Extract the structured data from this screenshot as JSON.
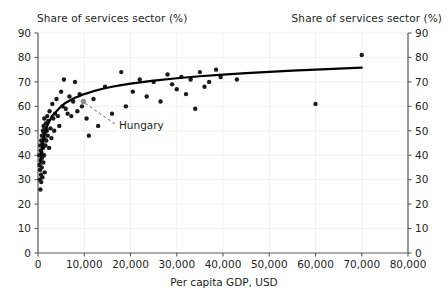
{
  "chart_data": {
    "type": "scatter",
    "title": "",
    "xlabel": "Per capita GDP, USD",
    "ylabel_left": "Share of services sector (%)",
    "ylabel_right": "Share of services sector (%)",
    "xlim": [
      0,
      80000
    ],
    "ylim": [
      0,
      90
    ],
    "xticks": [
      0,
      10000,
      20000,
      30000,
      40000,
      50000,
      60000,
      70000,
      80000
    ],
    "xtick_labels": [
      "0",
      "10,000",
      "20,000",
      "30,000",
      "40,000",
      "50,000",
      "60,000",
      "70,000",
      "80,000"
    ],
    "yticks": [
      0,
      10,
      20,
      30,
      40,
      50,
      60,
      70,
      80,
      90
    ],
    "ytick_labels": [
      "0",
      "10",
      "20",
      "30",
      "40",
      "50",
      "60",
      "70",
      "80",
      "90"
    ],
    "grid": true,
    "legend": "none",
    "marker_color": "#1a1a1a",
    "trendline_color": "#000000",
    "highlight_color": "#8c8c8c",
    "gridline_color": "#f0f0f0",
    "annotations": [
      {
        "label": "Hungary",
        "point_x": 9800,
        "point_y": 62,
        "label_x": 17500,
        "label_y": 52,
        "marker_color": "#8c8c8c",
        "leader_style": "dashed"
      }
    ],
    "series": [
      {
        "name": "Countries",
        "points": [
          [
            300,
            40
          ],
          [
            350,
            36
          ],
          [
            400,
            30
          ],
          [
            450,
            34
          ],
          [
            500,
            44
          ],
          [
            520,
            26
          ],
          [
            560,
            38
          ],
          [
            600,
            42
          ],
          [
            640,
            32
          ],
          [
            680,
            46
          ],
          [
            700,
            29
          ],
          [
            760,
            41
          ],
          [
            800,
            35
          ],
          [
            850,
            48
          ],
          [
            900,
            39
          ],
          [
            950,
            31
          ],
          [
            1000,
            45
          ],
          [
            1050,
            50
          ],
          [
            1100,
            43
          ],
          [
            1150,
            37
          ],
          [
            1200,
            52
          ],
          [
            1250,
            47
          ],
          [
            1300,
            40
          ],
          [
            1350,
            55
          ],
          [
            1400,
            49
          ],
          [
            1450,
            33
          ],
          [
            1500,
            51
          ],
          [
            1600,
            44
          ],
          [
            1700,
            53
          ],
          [
            1800,
            46
          ],
          [
            1900,
            50
          ],
          [
            2000,
            56
          ],
          [
            2100,
            48
          ],
          [
            2200,
            54
          ],
          [
            2400,
            43
          ],
          [
            2500,
            58
          ],
          [
            2700,
            51
          ],
          [
            2900,
            47
          ],
          [
            3100,
            61
          ],
          [
            3300,
            55
          ],
          [
            3500,
            50
          ],
          [
            3700,
            57
          ],
          [
            4000,
            63
          ],
          [
            4300,
            56
          ],
          [
            4600,
            52
          ],
          [
            5000,
            66
          ],
          [
            5300,
            60
          ],
          [
            5600,
            71
          ],
          [
            6000,
            59
          ],
          [
            6400,
            57
          ],
          [
            6800,
            64
          ],
          [
            7200,
            56
          ],
          [
            7600,
            62
          ],
          [
            8000,
            70
          ],
          [
            8500,
            58
          ],
          [
            9000,
            65
          ],
          [
            9500,
            60
          ],
          [
            9800,
            62
          ],
          [
            10500,
            55
          ],
          [
            11000,
            48
          ],
          [
            12000,
            63
          ],
          [
            13000,
            52
          ],
          [
            14500,
            68
          ],
          [
            16000,
            57
          ],
          [
            18000,
            74
          ],
          [
            19000,
            60
          ],
          [
            20500,
            66
          ],
          [
            22000,
            71
          ],
          [
            23500,
            64
          ],
          [
            25000,
            70
          ],
          [
            26500,
            62
          ],
          [
            28000,
            73
          ],
          [
            29000,
            69
          ],
          [
            30000,
            67
          ],
          [
            31000,
            72
          ],
          [
            32000,
            65
          ],
          [
            33000,
            71
          ],
          [
            34000,
            59
          ],
          [
            35000,
            74
          ],
          [
            36000,
            68
          ],
          [
            37000,
            70
          ],
          [
            38500,
            75
          ],
          [
            39500,
            72
          ],
          [
            43000,
            71
          ],
          [
            60000,
            61
          ],
          [
            70000,
            81
          ]
        ]
      }
    ],
    "trendline": {
      "type": "logarithmic",
      "description": "Share rises steeply below 10,000 USD then flattens toward ~76% at 70,000 USD",
      "points": [
        [
          500,
          37
        ],
        [
          1000,
          45
        ],
        [
          1500,
          49
        ],
        [
          2000,
          52
        ],
        [
          3000,
          56
        ],
        [
          4000,
          58
        ],
        [
          5000,
          60
        ],
        [
          6000,
          61.5
        ],
        [
          7000,
          62.5
        ],
        [
          8000,
          63.5
        ],
        [
          9000,
          64.2
        ],
        [
          10000,
          65
        ],
        [
          12000,
          66.2
        ],
        [
          14000,
          67.2
        ],
        [
          16000,
          68
        ],
        [
          18000,
          68.7
        ],
        [
          20000,
          69.3
        ],
        [
          25000,
          70.5
        ],
        [
          30000,
          71.5
        ],
        [
          35000,
          72.3
        ],
        [
          40000,
          73
        ],
        [
          45000,
          73.6
        ],
        [
          50000,
          74.1
        ],
        [
          55000,
          74.6
        ],
        [
          60000,
          75
        ],
        [
          65000,
          75.4
        ],
        [
          70000,
          75.8
        ]
      ]
    }
  }
}
